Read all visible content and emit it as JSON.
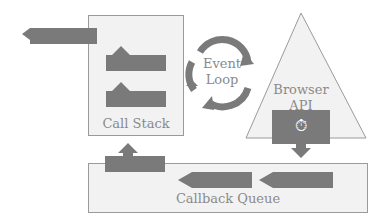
{
  "diagram": {
    "nodes": {
      "call_stack": {
        "label": "Call Stack",
        "frames": 2
      },
      "event_loop": {
        "label_line1": "Event",
        "label_line2": "Loop"
      },
      "browser_api": {
        "label_line1": "Browser",
        "label_line2": "API",
        "icon": "stopwatch-icon"
      },
      "callback_queue": {
        "label": "Callback Queue",
        "items": 2
      }
    },
    "edges": [
      {
        "from": "call_stack",
        "to": "output",
        "direction": "left"
      },
      {
        "from": "callback_queue",
        "to": "call_stack",
        "direction": "up"
      },
      {
        "from": "browser_api",
        "to": "callback_queue",
        "direction": "down"
      }
    ],
    "colors": {
      "fill": "#f2f2f2",
      "stroke": "#9a9a9a",
      "bar": "#7a7a7a",
      "text": "#8a8a8a"
    }
  }
}
